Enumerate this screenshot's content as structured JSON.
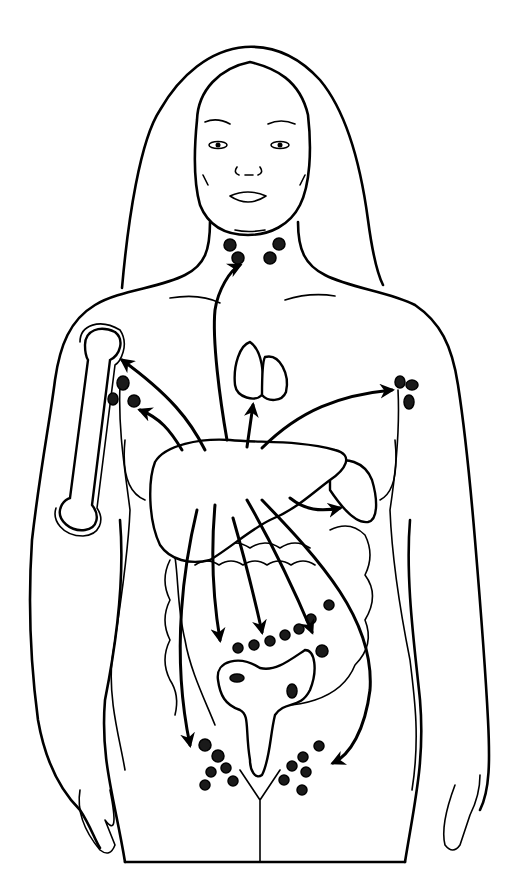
{
  "figure": {
    "type": "anatomical-illustration",
    "style": "black line drawing on white",
    "colors": {
      "line": "#000000",
      "background": "#ffffff",
      "stipple": "#111111"
    },
    "elements": [
      "head-with-long-hair",
      "cervical-lymph-nodes",
      "humerus-bone",
      "axillary-lymph-nodes-left",
      "axillary-lymph-nodes-right",
      "thymus-or-lungs",
      "liver-stippled-central",
      "spleen",
      "intestines",
      "uterus",
      "pelvic-lymph-nodes",
      "spread-arrows"
    ],
    "arrow_count": 11
  }
}
